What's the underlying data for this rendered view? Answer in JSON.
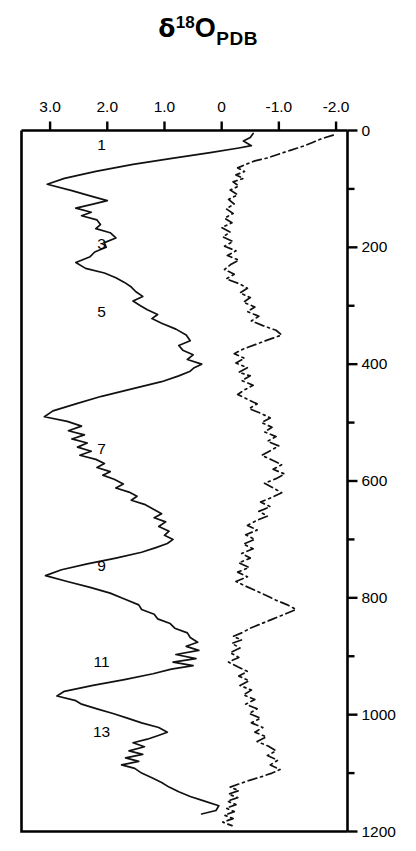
{
  "chart_data": {
    "type": "line",
    "title_parts": {
      "symbol": "δ",
      "superscript": "18",
      "base": "O",
      "subscript": "PDB"
    },
    "xlabel": "",
    "ylabel": "",
    "xlim": [
      3.5,
      -2.2
    ],
    "ylim": [
      0,
      1200
    ],
    "x_axis_position": "top",
    "y_axis_position": "right",
    "y_axis_direction": "down",
    "grid": false,
    "legend_position": "none",
    "xticks": [
      "3.0",
      "2.0",
      "1.0",
      "0",
      "-1.0",
      "-2.0"
    ],
    "xtick_values": [
      3.0,
      2.0,
      1.0,
      0,
      -1.0,
      -2.0
    ],
    "yticks": [
      "0",
      "200",
      "400",
      "600",
      "800",
      "1000",
      "1200"
    ],
    "ytick_values": [
      0,
      200,
      400,
      600,
      800,
      1000,
      1200
    ],
    "ytick_minor_values": [
      100,
      300,
      500,
      700,
      900,
      1100
    ],
    "annotations": [
      {
        "label": "1",
        "x": 2.1,
        "y": 25
      },
      {
        "label": "3",
        "x": 2.1,
        "y": 195
      },
      {
        "label": "5",
        "x": 2.1,
        "y": 310
      },
      {
        "label": "7",
        "x": 2.1,
        "y": 545
      },
      {
        "label": "9",
        "x": 2.1,
        "y": 745
      },
      {
        "label": "11",
        "x": 2.1,
        "y": 910
      },
      {
        "label": "13",
        "x": 2.1,
        "y": 1030
      }
    ],
    "series": [
      {
        "name": "solid-curve",
        "style": "solid",
        "color": "#111111",
        "points": [
          [
            -0.55,
            5
          ],
          [
            -0.5,
            12
          ],
          [
            -0.38,
            18
          ],
          [
            -0.52,
            26
          ],
          [
            -0.3,
            30
          ],
          [
            0.2,
            38
          ],
          [
            0.9,
            48
          ],
          [
            1.55,
            58
          ],
          [
            2.2,
            70
          ],
          [
            2.75,
            82
          ],
          [
            3.05,
            92
          ],
          [
            2.62,
            103
          ],
          [
            2.3,
            112
          ],
          [
            2.0,
            120
          ],
          [
            2.25,
            126
          ],
          [
            2.55,
            133
          ],
          [
            2.28,
            140
          ],
          [
            2.45,
            146
          ],
          [
            2.18,
            153
          ],
          [
            2.12,
            161
          ],
          [
            2.2,
            168
          ],
          [
            1.95,
            175
          ],
          [
            1.85,
            184
          ],
          [
            2.05,
            192
          ],
          [
            2.02,
            200
          ],
          [
            2.22,
            208
          ],
          [
            2.3,
            216
          ],
          [
            2.55,
            226
          ],
          [
            2.38,
            236
          ],
          [
            2.05,
            244
          ],
          [
            1.85,
            252
          ],
          [
            1.7,
            260
          ],
          [
            1.58,
            268
          ],
          [
            1.5,
            276
          ],
          [
            1.38,
            284
          ],
          [
            1.55,
            292
          ],
          [
            1.42,
            300
          ],
          [
            1.3,
            307
          ],
          [
            1.12,
            315
          ],
          [
            1.22,
            322
          ],
          [
            1.05,
            330
          ],
          [
            0.8,
            340
          ],
          [
            0.62,
            350
          ],
          [
            0.55,
            360
          ],
          [
            0.75,
            368
          ],
          [
            0.68,
            376
          ],
          [
            0.5,
            384
          ],
          [
            0.6,
            392
          ],
          [
            0.35,
            400
          ],
          [
            0.48,
            406
          ],
          [
            0.55,
            412
          ],
          [
            0.75,
            420
          ],
          [
            1.05,
            430
          ],
          [
            1.55,
            442
          ],
          [
            2.1,
            455
          ],
          [
            2.55,
            468
          ],
          [
            2.95,
            480
          ],
          [
            3.1,
            490
          ],
          [
            2.7,
            498
          ],
          [
            2.45,
            506
          ],
          [
            2.68,
            514
          ],
          [
            2.4,
            521
          ],
          [
            2.62,
            528
          ],
          [
            2.35,
            535
          ],
          [
            2.52,
            542
          ],
          [
            2.28,
            549
          ],
          [
            2.48,
            556
          ],
          [
            2.2,
            563
          ],
          [
            2.05,
            570
          ],
          [
            2.18,
            577
          ],
          [
            1.95,
            584
          ],
          [
            2.08,
            590
          ],
          [
            1.88,
            597
          ],
          [
            1.72,
            605
          ],
          [
            1.85,
            612
          ],
          [
            1.62,
            619
          ],
          [
            1.48,
            626
          ],
          [
            1.58,
            633
          ],
          [
            1.35,
            640
          ],
          [
            1.2,
            648
          ],
          [
            1.05,
            656
          ],
          [
            1.18,
            663
          ],
          [
            0.98,
            670
          ],
          [
            1.1,
            678
          ],
          [
            0.92,
            686
          ],
          [
            1.0,
            693
          ],
          [
            0.85,
            700
          ],
          [
            0.95,
            707
          ],
          [
            1.15,
            714
          ],
          [
            1.4,
            722
          ],
          [
            1.85,
            732
          ],
          [
            2.35,
            742
          ],
          [
            2.8,
            752
          ],
          [
            3.08,
            762
          ],
          [
            2.7,
            772
          ],
          [
            2.3,
            782
          ],
          [
            1.95,
            792
          ],
          [
            1.7,
            802
          ],
          [
            1.45,
            812
          ],
          [
            1.4,
            820
          ],
          [
            1.18,
            828
          ],
          [
            1.12,
            836
          ],
          [
            0.9,
            844
          ],
          [
            0.82,
            852
          ],
          [
            0.6,
            860
          ],
          [
            0.55,
            868
          ],
          [
            0.42,
            876
          ],
          [
            0.62,
            883
          ],
          [
            0.4,
            890
          ],
          [
            0.8,
            897
          ],
          [
            0.45,
            904
          ],
          [
            0.85,
            910
          ],
          [
            0.5,
            916
          ],
          [
            0.88,
            922
          ],
          [
            1.2,
            930
          ],
          [
            1.7,
            940
          ],
          [
            2.25,
            950
          ],
          [
            2.75,
            960
          ],
          [
            2.88,
            968
          ],
          [
            2.55,
            976
          ],
          [
            2.45,
            982
          ],
          [
            2.18,
            990
          ],
          [
            1.9,
            998
          ],
          [
            1.65,
            1006
          ],
          [
            1.4,
            1014
          ],
          [
            1.1,
            1022
          ],
          [
            0.95,
            1030
          ],
          [
            1.12,
            1036
          ],
          [
            1.3,
            1042
          ],
          [
            1.55,
            1048
          ],
          [
            1.35,
            1055
          ],
          [
            1.62,
            1062
          ],
          [
            1.38,
            1068
          ],
          [
            1.68,
            1074
          ],
          [
            1.45,
            1080
          ],
          [
            1.75,
            1086
          ],
          [
            1.52,
            1092
          ],
          [
            1.4,
            1100
          ],
          [
            1.22,
            1108
          ],
          [
            1.05,
            1116
          ],
          [
            0.92,
            1124
          ],
          [
            0.75,
            1132
          ],
          [
            0.55,
            1140
          ],
          [
            0.3,
            1148
          ],
          [
            0.05,
            1156
          ],
          [
            0.1,
            1164
          ],
          [
            0.35,
            1170
          ]
        ]
      },
      {
        "name": "dash-dot-curve",
        "style": "dash-dot",
        "color": "#111111",
        "points": [
          [
            -1.95,
            8
          ],
          [
            -1.75,
            14
          ],
          [
            -1.6,
            20
          ],
          [
            -1.42,
            27
          ],
          [
            -1.2,
            34
          ],
          [
            -0.98,
            41
          ],
          [
            -0.8,
            47
          ],
          [
            -0.58,
            52
          ],
          [
            -0.42,
            58
          ],
          [
            -0.28,
            64
          ],
          [
            -0.4,
            70
          ],
          [
            -0.25,
            76
          ],
          [
            -0.38,
            82
          ],
          [
            -0.2,
            88
          ],
          [
            -0.3,
            95
          ],
          [
            -0.15,
            102
          ],
          [
            -0.28,
            110
          ],
          [
            -0.12,
            118
          ],
          [
            -0.22,
            126
          ],
          [
            -0.08,
            134
          ],
          [
            -0.2,
            142
          ],
          [
            -0.05,
            150
          ],
          [
            -0.18,
            158
          ],
          [
            0.0,
            166
          ],
          [
            -0.15,
            174
          ],
          [
            -0.02,
            182
          ],
          [
            -0.2,
            190
          ],
          [
            -0.05,
            198
          ],
          [
            -0.25,
            206
          ],
          [
            -0.1,
            214
          ],
          [
            -0.3,
            222
          ],
          [
            -0.15,
            230
          ],
          [
            -0.05,
            238
          ],
          [
            -0.22,
            246
          ],
          [
            -0.08,
            254
          ],
          [
            -0.3,
            262
          ],
          [
            -0.45,
            270
          ],
          [
            -0.32,
            278
          ],
          [
            -0.5,
            286
          ],
          [
            -0.38,
            294
          ],
          [
            -0.58,
            302
          ],
          [
            -0.45,
            310
          ],
          [
            -0.65,
            318
          ],
          [
            -0.52,
            326
          ],
          [
            -0.72,
            334
          ],
          [
            -0.95,
            342
          ],
          [
            -1.05,
            350
          ],
          [
            -0.82,
            358
          ],
          [
            -0.6,
            366
          ],
          [
            -0.38,
            374
          ],
          [
            -0.22,
            382
          ],
          [
            -0.4,
            390
          ],
          [
            -0.25,
            398
          ],
          [
            -0.45,
            406
          ],
          [
            -0.3,
            414
          ],
          [
            -0.5,
            420
          ],
          [
            -0.35,
            428
          ],
          [
            -0.55,
            436
          ],
          [
            -0.4,
            444
          ],
          [
            -0.28,
            452
          ],
          [
            -0.45,
            460
          ],
          [
            -0.62,
            468
          ],
          [
            -0.48,
            476
          ],
          [
            -0.68,
            484
          ],
          [
            -0.85,
            492
          ],
          [
            -0.7,
            500
          ],
          [
            -0.88,
            508
          ],
          [
            -0.75,
            516
          ],
          [
            -0.95,
            524
          ],
          [
            -0.8,
            532
          ],
          [
            -1.0,
            540
          ],
          [
            -0.85,
            548
          ],
          [
            -0.7,
            556
          ],
          [
            -0.88,
            564
          ],
          [
            -1.05,
            572
          ],
          [
            -0.9,
            580
          ],
          [
            -1.1,
            588
          ],
          [
            -0.95,
            596
          ],
          [
            -0.75,
            604
          ],
          [
            -0.9,
            612
          ],
          [
            -1.05,
            620
          ],
          [
            -0.88,
            628
          ],
          [
            -0.68,
            636
          ],
          [
            -0.85,
            644
          ],
          [
            -0.65,
            652
          ],
          [
            -0.8,
            660
          ],
          [
            -0.6,
            668
          ],
          [
            -0.45,
            676
          ],
          [
            -0.62,
            684
          ],
          [
            -0.42,
            692
          ],
          [
            -0.58,
            700
          ],
          [
            -0.38,
            708
          ],
          [
            -0.55,
            716
          ],
          [
            -0.35,
            724
          ],
          [
            -0.5,
            732
          ],
          [
            -0.3,
            740
          ],
          [
            -0.48,
            748
          ],
          [
            -0.28,
            756
          ],
          [
            -0.45,
            764
          ],
          [
            -0.25,
            772
          ],
          [
            -0.42,
            780
          ],
          [
            -0.6,
            788
          ],
          [
            -0.78,
            796
          ],
          [
            -0.95,
            804
          ],
          [
            -1.15,
            812
          ],
          [
            -1.3,
            820
          ],
          [
            -1.1,
            828
          ],
          [
            -0.9,
            836
          ],
          [
            -0.7,
            844
          ],
          [
            -0.5,
            852
          ],
          [
            -0.35,
            860
          ],
          [
            -0.2,
            866
          ],
          [
            -0.35,
            872
          ],
          [
            -0.18,
            878
          ],
          [
            -0.32,
            886
          ],
          [
            -0.15,
            894
          ],
          [
            -0.3,
            902
          ],
          [
            -0.12,
            910
          ],
          [
            -0.28,
            918
          ],
          [
            -0.45,
            926
          ],
          [
            -0.3,
            934
          ],
          [
            -0.48,
            942
          ],
          [
            -0.32,
            950
          ],
          [
            -0.52,
            958
          ],
          [
            -0.38,
            966
          ],
          [
            -0.58,
            974
          ],
          [
            -0.42,
            982
          ],
          [
            -0.62,
            990
          ],
          [
            -0.48,
            998
          ],
          [
            -0.68,
            1006
          ],
          [
            -0.52,
            1014
          ],
          [
            -0.72,
            1022
          ],
          [
            -0.58,
            1030
          ],
          [
            -0.78,
            1038
          ],
          [
            -0.62,
            1046
          ],
          [
            -0.82,
            1054
          ],
          [
            -0.95,
            1062
          ],
          [
            -0.8,
            1070
          ],
          [
            -0.98,
            1078
          ],
          [
            -0.85,
            1086
          ],
          [
            -1.02,
            1094
          ],
          [
            -0.88,
            1100
          ],
          [
            -0.7,
            1106
          ],
          [
            -0.5,
            1112
          ],
          [
            -0.32,
            1118
          ],
          [
            -0.15,
            1124
          ],
          [
            -0.3,
            1130
          ],
          [
            -0.12,
            1136
          ],
          [
            -0.28,
            1142
          ],
          [
            -0.1,
            1148
          ],
          [
            -0.25,
            1154
          ],
          [
            -0.08,
            1160
          ],
          [
            -0.22,
            1166
          ],
          [
            -0.05,
            1172
          ],
          [
            -0.2,
            1178
          ],
          [
            -0.02,
            1184
          ],
          [
            -0.18,
            1190
          ]
        ]
      }
    ]
  }
}
